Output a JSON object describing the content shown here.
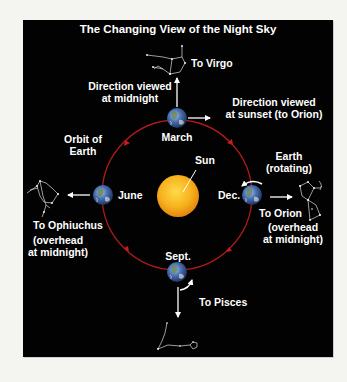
{
  "title": "The Changing View of the Night Sky",
  "colors": {
    "background": "#f4f4f1",
    "panel": "#020202",
    "orbit": "#b01a1a",
    "sun_inner": "#ffd23a",
    "sun_outer": "#e88a0a",
    "text": "#ffffff",
    "earth_blue": "#3a66b0"
  },
  "labels": {
    "to_virgo": "To Virgo",
    "direction_midnight": "Direction viewed\nat midnight",
    "direction_sunset": "Direction viewed\nat sunset (to Orion)",
    "march": "March",
    "orbit_of_earth": "Orbit of\nEarth",
    "sun": "Sun",
    "earth_rotating": "Earth\n(rotating)",
    "june": "June",
    "dec": "Dec.",
    "to_ophiuchus": "To Ophiuchus",
    "ophiuchus_note": "(overhead\nat midnight)",
    "to_orion": "To Orion",
    "orion_note": "(overhead\nat midnight)",
    "sept": "Sept.",
    "to_pisces": "To Pisces"
  },
  "positions": {
    "earths": [
      {
        "month": "March",
        "x": 177,
        "y": 118
      },
      {
        "month": "June",
        "x": 103,
        "y": 195
      },
      {
        "month": "Sept.",
        "x": 177,
        "y": 272
      },
      {
        "month": "Dec.",
        "x": 252,
        "y": 195
      }
    ],
    "orbit": {
      "cx": 177,
      "cy": 195,
      "r": 75,
      "direction": "counter-clockwise"
    }
  },
  "icons": [
    "sun-icon",
    "earth-icon",
    "constellation-virgo-icon",
    "constellation-ophiuchus-icon",
    "constellation-orion-icon",
    "constellation-pisces-icon",
    "arrow-icon",
    "rotation-arrow-icon"
  ]
}
